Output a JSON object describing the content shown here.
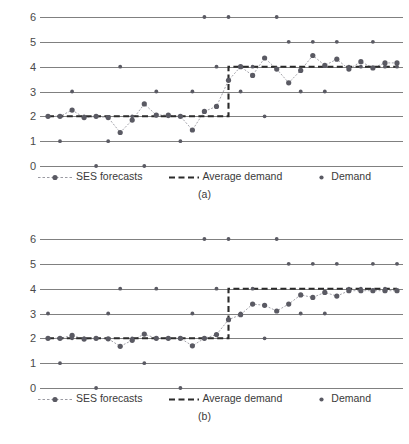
{
  "chart_data": [
    {
      "type": "line",
      "id": "chart-a",
      "caption": "(a)",
      "title": "",
      "xlabel": "",
      "ylabel": "",
      "ylim": [
        0,
        6
      ],
      "yticks": [
        0,
        1,
        2,
        3,
        4,
        5,
        6
      ],
      "grid": true,
      "legend_position": "bottom",
      "x": [
        1,
        2,
        3,
        4,
        5,
        6,
        7,
        8,
        9,
        10,
        11,
        12,
        13,
        14,
        15,
        16,
        17,
        18,
        19,
        20,
        21,
        22,
        23,
        24,
        25,
        26,
        27,
        28,
        29,
        30
      ],
      "series": [
        {
          "name": "Demand",
          "type": "scatter",
          "values": [
            2,
            1,
            3,
            2,
            0,
            1,
            4,
            2,
            0,
            3,
            2,
            1,
            3,
            6,
            4,
            6,
            3,
            4,
            2,
            6,
            5,
            3,
            5,
            3,
            5,
            4,
            4,
            5,
            4,
            4
          ]
        },
        {
          "name": "SES forecasts",
          "type": "line",
          "values": [
            2.0,
            2.0,
            2.25,
            1.95,
            2.0,
            1.95,
            1.35,
            1.85,
            2.5,
            2.05,
            2.05,
            2.0,
            1.45,
            2.2,
            2.4,
            3.45,
            4.0,
            3.65,
            4.35,
            3.9,
            3.35,
            3.85,
            4.45,
            4.05,
            4.3,
            3.9,
            4.2,
            3.95,
            4.15,
            4.15
          ]
        },
        {
          "name": "Average demand",
          "type": "step",
          "values": [
            2,
            2,
            2,
            2,
            2,
            2,
            2,
            2,
            2,
            2,
            2,
            2,
            2,
            2,
            2,
            4,
            4,
            4,
            4,
            4,
            4,
            4,
            4,
            4,
            4,
            4,
            4,
            4,
            4,
            4
          ]
        }
      ]
    },
    {
      "type": "line",
      "id": "chart-b",
      "caption": "(b)",
      "title": "",
      "xlabel": "",
      "ylabel": "",
      "ylim": [
        0,
        6
      ],
      "yticks": [
        0,
        1,
        2,
        3,
        4,
        5,
        6
      ],
      "grid": true,
      "legend_position": "bottom",
      "x": [
        1,
        2,
        3,
        4,
        5,
        6,
        7,
        8,
        9,
        10,
        11,
        12,
        13,
        14,
        15,
        16,
        17,
        18,
        19,
        20,
        21,
        22,
        23,
        24,
        25,
        26,
        27,
        28,
        29,
        30
      ],
      "series": [
        {
          "name": "Demand",
          "type": "scatter",
          "values": [
            3,
            1,
            2,
            2,
            0,
            3,
            4,
            2,
            1,
            4,
            2,
            0,
            3,
            6,
            4,
            6,
            3,
            4,
            2,
            6,
            5,
            3,
            5,
            3,
            5,
            4,
            4,
            5,
            4,
            5
          ]
        },
        {
          "name": "SES forecasts",
          "type": "line",
          "values": [
            2.0,
            2.0,
            2.12,
            1.97,
            2.0,
            1.98,
            1.68,
            1.92,
            2.17,
            2.0,
            2.0,
            2.0,
            1.7,
            2.0,
            2.15,
            2.75,
            2.95,
            3.38,
            3.33,
            3.1,
            3.38,
            3.75,
            3.65,
            3.85,
            3.7,
            3.92,
            3.92,
            3.92,
            3.92,
            3.92
          ]
        },
        {
          "name": "Average demand",
          "type": "step",
          "values": [
            2,
            2,
            2,
            2,
            2,
            2,
            2,
            2,
            2,
            2,
            2,
            2,
            2,
            2,
            2,
            4,
            4,
            4,
            4,
            4,
            4,
            4,
            4,
            4,
            4,
            4,
            4,
            4,
            4,
            4
          ]
        }
      ]
    }
  ],
  "legend": {
    "ses_label": "SES forecasts",
    "avg_label": "Average demand",
    "demand_label": "Demand"
  },
  "captions": {
    "a": "(a)",
    "b": "(b)"
  },
  "colors": {
    "grid": "#808080",
    "marker": "#5a5a63",
    "ses_line": "#9a9aa2",
    "avg_line": "#2b2b2b",
    "text": "#3a3a3a"
  }
}
